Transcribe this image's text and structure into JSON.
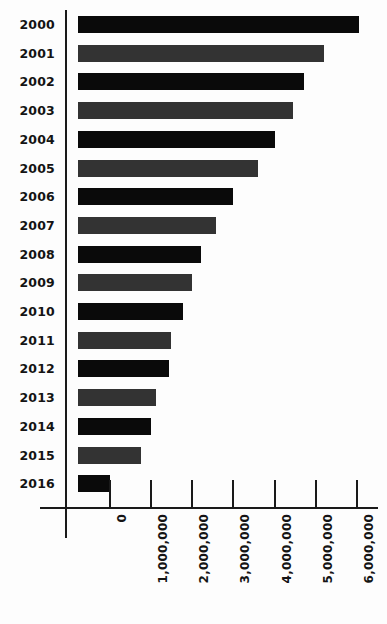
{
  "chart_data": {
    "type": "bar",
    "orientation": "horizontal",
    "title": "",
    "subtitle": "",
    "xlabel": "",
    "ylabel": "",
    "grid": false,
    "legend": "none",
    "xlim": [
      0,
      6500000
    ],
    "categories": [
      "2000",
      "2001",
      "2002",
      "2003",
      "2004",
      "2005",
      "2006",
      "2007",
      "2008",
      "2009",
      "2010",
      "2011",
      "2012",
      "2013",
      "2014",
      "2015",
      "2016"
    ],
    "values": [
      6800000,
      5950000,
      5200000,
      5150000,
      4750000,
      4300000,
      3720000,
      3300000,
      3000000,
      2750000,
      2530000,
      2230000,
      2180000,
      1870000,
      1750000,
      1500000,
      760000
    ],
    "tick_labels": [
      "0",
      "1,000,000",
      "2,000,000",
      "3,000,000",
      "4,000,000",
      "5,000,000",
      "6,000,000"
    ],
    "tick_values": [
      0,
      1000000,
      2000000,
      3000000,
      4000000,
      5000000,
      6000000
    ],
    "bar_colors": [
      "#0a0a0a",
      "#333333"
    ],
    "bars": [
      {
        "category": "2000",
        "value": 6800000,
        "color": "dark",
        "end_px": 359,
        "top_px": 16
      },
      {
        "category": "2001",
        "value": 5950000,
        "color": "gray",
        "end_px": 324,
        "top_px": 45
      },
      {
        "category": "2002",
        "value": 5200000,
        "color": "dark",
        "end_px": 304,
        "top_px": 74
      },
      {
        "category": "2003",
        "value": 5150000,
        "color": "gray",
        "end_px": 293,
        "top_px": 103
      },
      {
        "category": "2004",
        "value": 4750000,
        "color": "dark",
        "end_px": 275,
        "top_px": 132
      },
      {
        "category": "2005",
        "value": 4300000,
        "color": "gray",
        "end_px": 258,
        "top_px": 161
      },
      {
        "category": "2006",
        "value": 3720000,
        "color": "dark",
        "end_px": 233,
        "top_px": 190
      },
      {
        "category": "2007",
        "value": 3300000,
        "color": "gray",
        "end_px": 216,
        "top_px": 219
      },
      {
        "category": "2008",
        "value": 3000000,
        "color": "dark",
        "end_px": 201,
        "top_px": 248
      },
      {
        "category": "2009",
        "value": 2750000,
        "color": "gray",
        "end_px": 192,
        "top_px": 277
      },
      {
        "category": "2010",
        "value": 2530000,
        "color": "dark",
        "end_px": 183,
        "top_px": 306
      },
      {
        "category": "2011",
        "value": 2230000,
        "color": "gray",
        "end_px": 171,
        "top_px": 335
      },
      {
        "category": "2012",
        "value": 2180000,
        "color": "dark",
        "end_px": 169,
        "top_px": 364
      },
      {
        "category": "2013",
        "value": 1870000,
        "color": "gray",
        "end_px": 156,
        "top_px": 393
      },
      {
        "category": "2014",
        "value": 1750000,
        "color": "dark",
        "end_px": 151,
        "top_px": 422
      },
      {
        "category": "2015",
        "value": 1500000,
        "color": "gray",
        "end_px": 141,
        "top_px": 451
      },
      {
        "category": "2016",
        "value": 760000,
        "color": "dark",
        "end_px": 110,
        "top_px": 451
      }
    ],
    "axis": {
      "tick_px": [
        109,
        150,
        191,
        232,
        274,
        315,
        356
      ],
      "bar_origin_px": 78,
      "bar_height_px": 17,
      "row_pitch_px": 28.7,
      "first_row_top_px": 16
    }
  }
}
